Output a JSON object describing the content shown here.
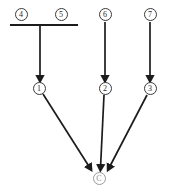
{
  "diagram": {
    "type": "flow-graph",
    "background_color": "#ffffff",
    "stroke_color": "#1c1c1c",
    "faint_color": "#8d8d8d",
    "nodes": [
      {
        "id": "n4",
        "label": "4",
        "display": "④",
        "x": 21,
        "y": 14,
        "r": 6.5,
        "style": "normal",
        "row": "top"
      },
      {
        "id": "n5",
        "label": "5",
        "display": "⑤",
        "x": 61,
        "y": 14,
        "r": 6.5,
        "style": "normal",
        "row": "top"
      },
      {
        "id": "n6",
        "label": "6",
        "display": "⑥",
        "x": 105,
        "y": 14,
        "r": 6.5,
        "style": "normal",
        "row": "top"
      },
      {
        "id": "n7",
        "label": "7",
        "display": "⑦",
        "x": 150,
        "y": 14,
        "r": 6.5,
        "style": "normal",
        "row": "top"
      },
      {
        "id": "n1",
        "label": "1",
        "display": "①",
        "x": 39,
        "y": 88,
        "r": 6.5,
        "style": "normal",
        "row": "middle"
      },
      {
        "id": "n2",
        "label": "2",
        "display": "②",
        "x": 105,
        "y": 88,
        "r": 6.5,
        "style": "normal",
        "row": "middle"
      },
      {
        "id": "n3",
        "label": "3",
        "display": "③",
        "x": 150,
        "y": 88,
        "r": 6.5,
        "style": "normal",
        "row": "middle"
      },
      {
        "id": "nc",
        "label": "C",
        "display": "Ⓒ",
        "x": 99,
        "y": 178,
        "r": 6.5,
        "style": "faint",
        "row": "bottom"
      }
    ],
    "join_bar": {
      "id": "bar-45",
      "x1": 10,
      "x2": 78,
      "y": 25,
      "stem_x": 40,
      "joins": [
        "n4",
        "n5"
      ],
      "target": "n1"
    },
    "edges": [
      {
        "id": "e-bar-1",
        "from": "bar-45",
        "to": "n1",
        "kind": "arrow",
        "x1": 40,
        "y1": 25,
        "x2": 40,
        "y2": 80
      },
      {
        "id": "e-6-2",
        "from": "n6",
        "to": "n2",
        "kind": "arrow",
        "x1": 105,
        "y1": 22,
        "x2": 105,
        "y2": 80
      },
      {
        "id": "e-7-3",
        "from": "n7",
        "to": "n3",
        "kind": "arrow",
        "x1": 150,
        "y1": 22,
        "x2": 150,
        "y2": 80
      },
      {
        "id": "e-1-c",
        "from": "n1",
        "to": "nc",
        "kind": "arrow",
        "x1": 43,
        "y1": 94,
        "x2": 92,
        "y2": 170
      },
      {
        "id": "e-2-c",
        "from": "n2",
        "to": "nc",
        "kind": "arrow",
        "x1": 103,
        "y1": 95,
        "x2": 100,
        "y2": 170
      },
      {
        "id": "e-3-c",
        "from": "n3",
        "to": "nc",
        "kind": "arrow",
        "x1": 147,
        "y1": 95,
        "x2": 108,
        "y2": 170
      }
    ]
  }
}
